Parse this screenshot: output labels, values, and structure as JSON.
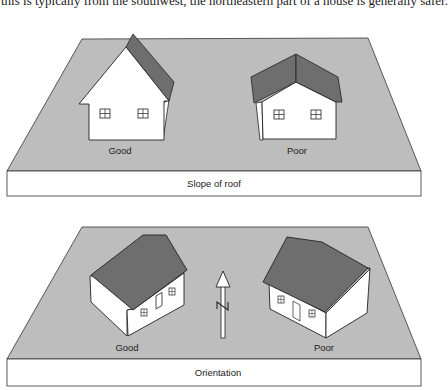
{
  "caption": "this is typically from the southwest, the northeastern part of a house is generally safer.",
  "colors": {
    "ground": "#bdbdbd",
    "roof": "#6e6e6e",
    "wall": "#ffffff",
    "outline": "#222222"
  },
  "panels": [
    {
      "title": "Slope of roof",
      "houses": [
        {
          "label": "Good",
          "description": "steep roof"
        },
        {
          "label": "Poor",
          "description": "shallow roof"
        }
      ]
    },
    {
      "title": "Orientation",
      "compass": {
        "label": "N",
        "icon": "north-arrow-icon"
      },
      "houses": [
        {
          "label": "Good",
          "description": "house oriented diagonally"
        },
        {
          "label": "Poor",
          "description": "house oriented diagonally opposite"
        }
      ]
    }
  ]
}
